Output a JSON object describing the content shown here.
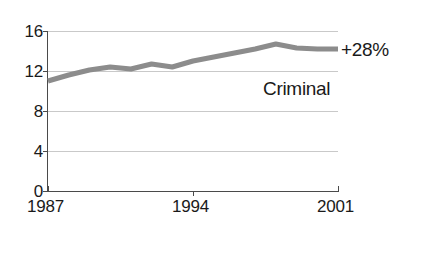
{
  "chart_data": {
    "type": "line",
    "title": "",
    "subtitle": "",
    "xlabel": "",
    "ylabel": "",
    "grid": true,
    "legend_position": "inline-right",
    "x": [
      1987,
      1988,
      1989,
      1990,
      1991,
      1992,
      1993,
      1994,
      1995,
      1996,
      1997,
      1998,
      1999,
      2000,
      2001
    ],
    "xlim": [
      1987,
      2001
    ],
    "ylim": [
      0,
      16
    ],
    "xticks": [
      1987,
      1994,
      2001
    ],
    "xtick_labels": [
      "1987",
      "1994",
      "2001"
    ],
    "yticks": [
      0,
      4,
      8,
      12,
      16
    ],
    "ytick_labels": [
      "0",
      "4",
      "8",
      "12",
      "16"
    ],
    "series": [
      {
        "name": "Criminal",
        "color": "#8c8c8c",
        "line_width": 5,
        "values": [
          11.0,
          11.6,
          12.1,
          12.4,
          12.2,
          12.7,
          12.4,
          13.0,
          13.4,
          13.8,
          14.2,
          14.7,
          14.3,
          14.2,
          14.2
        ]
      }
    ],
    "annotations": [
      {
        "id": "growth",
        "text": "+28%",
        "x": 2001,
        "y": 14.2,
        "placement": "right-of-line-end"
      },
      {
        "id": "series_label",
        "text": "Criminal",
        "x": 1997,
        "y": 11.2,
        "placement": "inline-below-line"
      }
    ]
  },
  "axes": {
    "y": {
      "labels": [
        "16",
        "12",
        "8",
        "4",
        "0"
      ],
      "values": [
        16,
        12,
        8,
        4,
        0
      ]
    },
    "x": {
      "labels": [
        "1987",
        "1994",
        "2001"
      ],
      "values": [
        1987,
        1994,
        2001
      ]
    }
  },
  "annotations": {
    "growth_label": "+28%",
    "series_label": "Criminal"
  },
  "colors": {
    "series_line": "#8c8c8c",
    "gridline": "#c9c9c9",
    "axis": "#4a4a4a",
    "text": "#1a1a1a",
    "background": "#ffffff"
  }
}
